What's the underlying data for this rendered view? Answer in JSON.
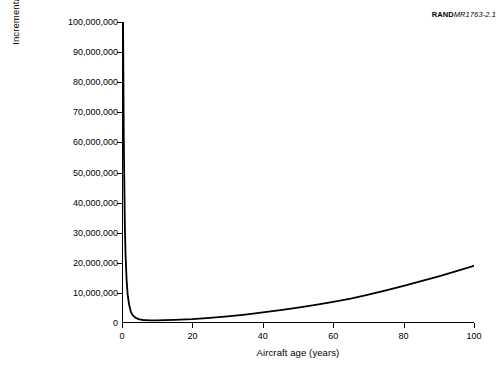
{
  "credit": {
    "bold": "RAND",
    "italic": "MR1763-2.1"
  },
  "chart_data": {
    "type": "line",
    "title": "",
    "xlabel": "Aircraft age (years)",
    "ylabel": "Incremental cost per available year ($)",
    "xlim": [
      0,
      100
    ],
    "ylim": [
      0,
      100000000
    ],
    "grid": false,
    "legend": null,
    "xticks": [
      0,
      20,
      40,
      60,
      80,
      100
    ],
    "xtick_labels": [
      "0",
      "20",
      "40",
      "60",
      "80",
      "100"
    ],
    "yticks": [
      0,
      10000000,
      20000000,
      30000000,
      40000000,
      50000000,
      60000000,
      70000000,
      80000000,
      90000000,
      100000000
    ],
    "ytick_labels": [
      "0",
      "10,000,000",
      "20,000,000",
      "30,000,000",
      "40,000,000",
      "50,000,000",
      "60,000,000",
      "70,000,000",
      "80,000,000",
      "90,000,000",
      "100,000,000"
    ],
    "series": [
      {
        "name": "Incremental cost per available year",
        "x": [
          0.3,
          0.5,
          0.8,
          1.0,
          1.3,
          1.6,
          2.0,
          2.5,
          3.0,
          4.0,
          5.0,
          6.0,
          8.0,
          10.0,
          12.0,
          15.0,
          20.0,
          25.0,
          30.0,
          35.0,
          40.0,
          45.0,
          50.0,
          55.0,
          60.0,
          65.0,
          70.0,
          75.0,
          80.0,
          85.0,
          90.0,
          95.0,
          100.0
        ],
        "y": [
          100000000,
          62000000,
          33000000,
          23000000,
          14500000,
          9500000,
          6200000,
          3800000,
          2600000,
          1600000,
          1200000,
          1000000,
          900000,
          900000,
          950000,
          1050000,
          1300000,
          1700000,
          2200000,
          2800000,
          3500000,
          4300000,
          5100000,
          6000000,
          7000000,
          8100000,
          9400000,
          10800000,
          12300000,
          13900000,
          15500000,
          17200000,
          19000000
        ]
      }
    ]
  }
}
